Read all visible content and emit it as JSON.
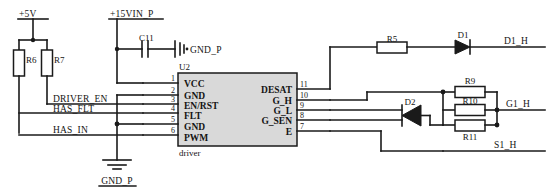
{
  "diagram": {
    "ic": {
      "designator": "U2",
      "subtitle": "driver",
      "left_pins": [
        {
          "num": "1",
          "name": "VCC"
        },
        {
          "num": "2",
          "name": "GND"
        },
        {
          "num": "3",
          "name": "EN/RST"
        },
        {
          "num": "4",
          "name": "FLT"
        },
        {
          "num": "5",
          "name": "GND"
        },
        {
          "num": "6",
          "name": "PWM"
        }
      ],
      "right_pins": [
        {
          "num": "11",
          "name": "DESAT"
        },
        {
          "num": "10",
          "name": "G_H"
        },
        {
          "num": "9",
          "name": "G_L"
        },
        {
          "num": "8",
          "name": "G_SEN"
        },
        {
          "num": "7",
          "name": "E"
        }
      ]
    },
    "power_nets": [
      {
        "id": "net-5v",
        "label": "+5V"
      },
      {
        "id": "net-15vin-p",
        "label": "+15VIN_P"
      }
    ],
    "ground_nets": [
      {
        "id": "gnd-p-cap",
        "label": "GND_P"
      },
      {
        "id": "gnd-p-ic",
        "label": "GND_P"
      }
    ],
    "signal_nets": [
      {
        "id": "driver-en",
        "label": "DRIVER_EN"
      },
      {
        "id": "has-flt",
        "label": "HAS_FLT"
      },
      {
        "id": "has-in",
        "label": "HAS_IN"
      },
      {
        "id": "d1-h",
        "label": "D1_H"
      },
      {
        "id": "g1-h",
        "label": "G1_H"
      },
      {
        "id": "s1-h",
        "label": "S1_H"
      }
    ],
    "components": [
      {
        "id": "r6",
        "designator": "R6",
        "type": "resistor"
      },
      {
        "id": "r7",
        "designator": "R7",
        "type": "resistor"
      },
      {
        "id": "c11",
        "designator": "C11",
        "type": "capacitor"
      },
      {
        "id": "r5",
        "designator": "R5",
        "type": "resistor"
      },
      {
        "id": "d1",
        "designator": "D1",
        "type": "diode"
      },
      {
        "id": "d2",
        "designator": "D2",
        "type": "diode"
      },
      {
        "id": "r9",
        "designator": "R9",
        "type": "resistor"
      },
      {
        "id": "r10",
        "designator": "R10",
        "type": "resistor"
      },
      {
        "id": "r11",
        "designator": "R11",
        "type": "resistor"
      }
    ],
    "colors": {
      "background": "#ffffff",
      "wire": "#1a1a1a",
      "ic_fill": "#d9d9d9",
      "text": "#141414"
    }
  }
}
